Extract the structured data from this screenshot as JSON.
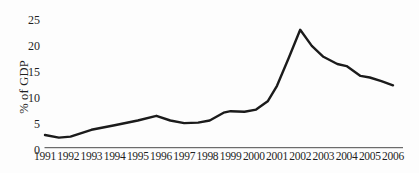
{
  "figure": {
    "kind": "scanned-line-chart"
  },
  "chart_data": {
    "type": "line",
    "title": "",
    "xlabel": "",
    "ylabel": "% of GDP",
    "x": [
      1991.0,
      1991.6,
      1992.1,
      1993.0,
      1994.0,
      1995.0,
      1995.8,
      1996.4,
      1997.0,
      1997.6,
      1998.1,
      1998.7,
      1999.0,
      1999.6,
      2000.1,
      2000.6,
      2001.0,
      2001.5,
      2002.0,
      2002.5,
      2003.0,
      2003.6,
      2004.0,
      2004.6,
      2005.0,
      2005.5,
      2006.0
    ],
    "y": [
      2.8,
      2.3,
      2.5,
      3.8,
      4.7,
      5.6,
      6.5,
      5.6,
      5.1,
      5.2,
      5.6,
      7.1,
      7.4,
      7.3,
      7.7,
      9.3,
      12.3,
      17.6,
      23.1,
      20.0,
      17.9,
      16.5,
      16.1,
      14.2,
      13.9,
      13.2,
      12.4
    ],
    "x_ticks": [
      1991,
      1992,
      1993,
      1994,
      1995,
      1996,
      1997,
      1998,
      1999,
      2000,
      2001,
      2002,
      2003,
      2004,
      2005,
      2006
    ],
    "y_ticks": [
      0,
      5,
      10,
      15,
      20,
      25
    ],
    "xlim": [
      1991,
      2006
    ],
    "ylim": [
      0,
      25
    ],
    "grid": false,
    "legend": null,
    "series_name": "",
    "line_color": "#1b1b1b",
    "line_width": 2.4,
    "axis_color": "#4a4a4a",
    "text_color": "#1f1f1f",
    "background": "#fdfdfd"
  }
}
